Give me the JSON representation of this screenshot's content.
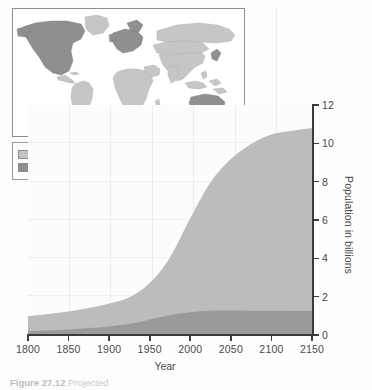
{
  "chart_data": {
    "type": "area",
    "stacked": true,
    "title": "",
    "xlabel": "Year",
    "ylabel": "Population in billions",
    "xlim": [
      1800,
      2150
    ],
    "ylim": [
      0,
      12
    ],
    "xticks": [
      1800,
      1850,
      1900,
      1950,
      2000,
      2050,
      2100,
      2150
    ],
    "yticks": [
      0,
      2,
      4,
      6,
      8,
      10,
      12
    ],
    "grid": true,
    "legend_position": "upper-left",
    "x": [
      1800,
      1825,
      1850,
      1875,
      1900,
      1925,
      1950,
      1975,
      2000,
      2025,
      2050,
      2075,
      2100,
      2125,
      2150
    ],
    "series": [
      {
        "name": "More-developed countries",
        "color": "#9a9a9a",
        "values": [
          0.2,
          0.24,
          0.29,
          0.36,
          0.45,
          0.57,
          0.81,
          1.05,
          1.19,
          1.27,
          1.28,
          1.27,
          1.26,
          1.25,
          1.25
        ]
      },
      {
        "name": "Less-developed countries",
        "color": "#bcbcbc",
        "values": [
          0.78,
          0.86,
          0.94,
          1.05,
          1.2,
          1.4,
          1.9,
          3.0,
          4.9,
          6.7,
          7.9,
          8.7,
          9.2,
          9.4,
          9.55
        ]
      }
    ],
    "totals": [
      0.98,
      1.1,
      1.23,
      1.41,
      1.65,
      1.97,
      2.71,
      4.05,
      6.09,
      7.97,
      9.18,
      9.97,
      10.46,
      10.65,
      10.8
    ]
  },
  "axes": {
    "y_title": "Population in billions",
    "x_title": "Year",
    "y_tick_labels": [
      "0",
      "2",
      "4",
      "6",
      "8",
      "10",
      "12"
    ],
    "x_tick_labels": [
      "1800",
      "1850",
      "1900",
      "1950",
      "2000",
      "2050",
      "2100",
      "2150"
    ]
  },
  "legend": {
    "items": [
      {
        "label": "Less-developed countries",
        "color": "#bcbcbc"
      },
      {
        "label": "More-developed countries",
        "color": "#9a9a9a"
      }
    ]
  },
  "map": {
    "title": "world-map-development-status",
    "more_developed_color": "#9a9a9a",
    "less_developed_color": "#c6c6c6",
    "ocean_color": "#ffffff"
  },
  "caption": {
    "figure_number": "Figure 27.12",
    "text": "Projected"
  }
}
